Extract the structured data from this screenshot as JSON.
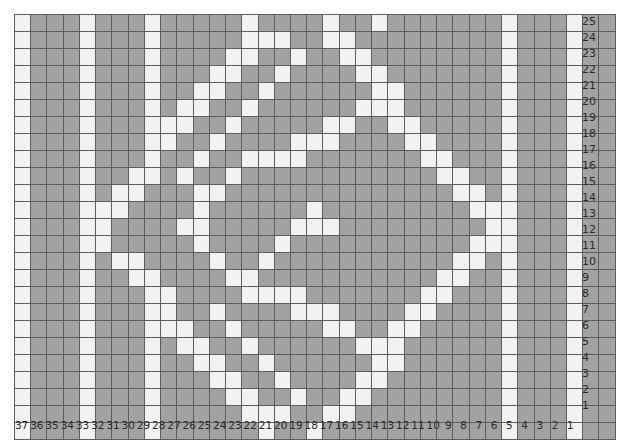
{
  "chart": {
    "title": "",
    "type": "grid-pattern-chart",
    "filled_color": "#a2a2a2",
    "empty_color": "#f2f2f2",
    "grid_line_color": "#5d5d5d",
    "columns": 37,
    "rows": 25,
    "column_order": "right-to-left",
    "row_order": "bottom-to-top",
    "column_labels": [
      37,
      36,
      35,
      34,
      33,
      32,
      31,
      30,
      29,
      28,
      27,
      26,
      25,
      24,
      23,
      22,
      21,
      20,
      19,
      18,
      17,
      16,
      15,
      14,
      13,
      12,
      11,
      10,
      9,
      8,
      7,
      6,
      5,
      4,
      3,
      2,
      1
    ],
    "row_labels": [
      25,
      24,
      23,
      22,
      21,
      20,
      19,
      18,
      17,
      16,
      15,
      14,
      13,
      12,
      11,
      10,
      9,
      8,
      7,
      6,
      5,
      4,
      3,
      2,
      1
    ]
  },
  "chart_data": {
    "type": "heatmap",
    "title": "",
    "xlabel": "",
    "ylabel": "",
    "legend": [
      {
        "key": "1",
        "label": "filled",
        "color": "#a2a2a2"
      },
      {
        "key": "0",
        "label": "empty",
        "color": "#f2f2f2"
      }
    ],
    "x": [
      37,
      36,
      35,
      34,
      33,
      32,
      31,
      30,
      29,
      28,
      27,
      26,
      25,
      24,
      23,
      22,
      21,
      20,
      19,
      18,
      17,
      16,
      15,
      14,
      13,
      12,
      11,
      10,
      9,
      8,
      7,
      6,
      5,
      4,
      3,
      2,
      1
    ],
    "y": [
      25,
      24,
      23,
      22,
      21,
      20,
      19,
      18,
      17,
      16,
      15,
      14,
      13,
      12,
      11,
      10,
      9,
      8,
      7,
      6,
      5,
      4,
      3,
      2,
      1
    ],
    "grid": [
      [
        0,
        1,
        1,
        1,
        0,
        1,
        1,
        1,
        0,
        1,
        1,
        1,
        1,
        1,
        0,
        1,
        1,
        1,
        1,
        0,
        1,
        1,
        0,
        1,
        1,
        1,
        1,
        1,
        1,
        1,
        0,
        1,
        1,
        1,
        0,
        1,
        1
      ],
      [
        0,
        1,
        1,
        1,
        0,
        1,
        1,
        1,
        0,
        1,
        1,
        1,
        1,
        1,
        0,
        0,
        0,
        1,
        1,
        0,
        0,
        1,
        1,
        1,
        1,
        1,
        1,
        1,
        1,
        1,
        0,
        1,
        1,
        1,
        0,
        1,
        1
      ],
      [
        0,
        1,
        1,
        1,
        0,
        1,
        1,
        1,
        0,
        1,
        1,
        1,
        1,
        0,
        0,
        1,
        1,
        0,
        1,
        1,
        0,
        0,
        1,
        1,
        1,
        1,
        1,
        1,
        1,
        1,
        0,
        1,
        1,
        1,
        0,
        1,
        1
      ],
      [
        0,
        1,
        1,
        1,
        0,
        1,
        1,
        1,
        0,
        1,
        1,
        1,
        0,
        0,
        1,
        1,
        0,
        1,
        1,
        1,
        1,
        0,
        0,
        1,
        1,
        1,
        1,
        1,
        1,
        1,
        0,
        1,
        1,
        1,
        0,
        1,
        1
      ],
      [
        0,
        1,
        1,
        1,
        0,
        1,
        1,
        1,
        0,
        1,
        1,
        0,
        0,
        1,
        1,
        0,
        1,
        1,
        1,
        1,
        1,
        1,
        0,
        0,
        1,
        1,
        1,
        1,
        1,
        1,
        0,
        1,
        1,
        1,
        0,
        1,
        1
      ],
      [
        0,
        1,
        1,
        1,
        0,
        1,
        1,
        1,
        0,
        1,
        0,
        0,
        1,
        1,
        0,
        1,
        1,
        1,
        1,
        1,
        1,
        0,
        0,
        0,
        1,
        1,
        1,
        1,
        1,
        1,
        0,
        1,
        1,
        1,
        0,
        1,
        1
      ],
      [
        0,
        1,
        1,
        1,
        0,
        1,
        1,
        1,
        0,
        0,
        0,
        1,
        1,
        0,
        1,
        1,
        1,
        1,
        1,
        0,
        0,
        1,
        1,
        0,
        0,
        1,
        1,
        1,
        1,
        1,
        0,
        1,
        1,
        1,
        0,
        1,
        1
      ],
      [
        0,
        1,
        1,
        1,
        0,
        1,
        1,
        1,
        0,
        0,
        1,
        1,
        0,
        1,
        1,
        1,
        1,
        0,
        0,
        0,
        1,
        1,
        1,
        1,
        0,
        0,
        1,
        1,
        1,
        1,
        0,
        1,
        1,
        1,
        0,
        1,
        1
      ],
      [
        0,
        1,
        1,
        1,
        0,
        1,
        1,
        1,
        0,
        1,
        1,
        0,
        1,
        1,
        0,
        0,
        0,
        0,
        1,
        1,
        1,
        1,
        1,
        1,
        1,
        0,
        0,
        1,
        1,
        1,
        0,
        1,
        1,
        1,
        0,
        1,
        1
      ],
      [
        0,
        1,
        1,
        1,
        0,
        1,
        1,
        0,
        0,
        1,
        0,
        1,
        1,
        0,
        1,
        1,
        1,
        1,
        1,
        1,
        1,
        1,
        1,
        1,
        1,
        1,
        0,
        0,
        1,
        1,
        0,
        1,
        1,
        1,
        0,
        1,
        1
      ],
      [
        0,
        1,
        1,
        1,
        0,
        1,
        0,
        0,
        1,
        1,
        1,
        0,
        0,
        1,
        1,
        1,
        1,
        1,
        1,
        1,
        1,
        1,
        1,
        1,
        1,
        1,
        1,
        0,
        0,
        1,
        0,
        1,
        1,
        1,
        0,
        1,
        1
      ],
      [
        0,
        1,
        1,
        1,
        0,
        0,
        0,
        1,
        1,
        1,
        1,
        0,
        1,
        1,
        1,
        1,
        1,
        1,
        0,
        1,
        1,
        1,
        1,
        1,
        1,
        1,
        1,
        1,
        0,
        0,
        0,
        1,
        1,
        1,
        0,
        1,
        1
      ],
      [
        0,
        1,
        1,
        1,
        0,
        0,
        1,
        1,
        1,
        1,
        0,
        0,
        1,
        1,
        1,
        1,
        1,
        0,
        0,
        0,
        1,
        1,
        1,
        1,
        1,
        1,
        1,
        1,
        1,
        0,
        0,
        1,
        1,
        1,
        0,
        1,
        1
      ],
      [
        0,
        1,
        1,
        1,
        0,
        0,
        1,
        1,
        1,
        1,
        1,
        0,
        1,
        1,
        1,
        1,
        0,
        1,
        1,
        1,
        1,
        1,
        1,
        1,
        1,
        1,
        1,
        1,
        0,
        0,
        0,
        1,
        1,
        1,
        0,
        1,
        1
      ],
      [
        0,
        1,
        1,
        1,
        0,
        1,
        0,
        0,
        1,
        1,
        1,
        1,
        0,
        1,
        1,
        0,
        1,
        1,
        1,
        1,
        1,
        1,
        1,
        1,
        1,
        1,
        1,
        0,
        0,
        1,
        0,
        1,
        1,
        1,
        0,
        1,
        1
      ],
      [
        0,
        1,
        1,
        1,
        0,
        1,
        1,
        0,
        0,
        1,
        1,
        1,
        1,
        0,
        0,
        1,
        1,
        1,
        1,
        1,
        1,
        1,
        1,
        1,
        1,
        1,
        0,
        0,
        1,
        1,
        0,
        1,
        1,
        1,
        0,
        1,
        1
      ],
      [
        0,
        1,
        1,
        1,
        0,
        1,
        1,
        1,
        0,
        0,
        1,
        1,
        1,
        1,
        0,
        0,
        0,
        0,
        1,
        1,
        1,
        1,
        1,
        1,
        1,
        0,
        0,
        1,
        1,
        1,
        0,
        1,
        1,
        1,
        0,
        1,
        1
      ],
      [
        0,
        1,
        1,
        1,
        0,
        1,
        1,
        1,
        0,
        0,
        1,
        1,
        0,
        1,
        1,
        1,
        1,
        0,
        0,
        0,
        1,
        1,
        1,
        1,
        0,
        0,
        1,
        1,
        1,
        1,
        0,
        1,
        1,
        1,
        0,
        1,
        1
      ],
      [
        0,
        1,
        1,
        1,
        0,
        1,
        1,
        1,
        0,
        0,
        0,
        1,
        1,
        0,
        1,
        1,
        1,
        1,
        1,
        0,
        0,
        1,
        1,
        0,
        0,
        1,
        1,
        1,
        1,
        1,
        0,
        1,
        1,
        1,
        0,
        1,
        1
      ],
      [
        0,
        1,
        1,
        1,
        0,
        1,
        1,
        1,
        0,
        1,
        0,
        0,
        1,
        1,
        0,
        1,
        1,
        1,
        1,
        1,
        1,
        0,
        0,
        0,
        1,
        1,
        1,
        1,
        1,
        1,
        0,
        1,
        1,
        1,
        0,
        1,
        1
      ],
      [
        0,
        1,
        1,
        1,
        0,
        1,
        1,
        1,
        0,
        1,
        1,
        0,
        0,
        1,
        1,
        0,
        1,
        1,
        1,
        1,
        1,
        1,
        0,
        0,
        1,
        1,
        1,
        1,
        1,
        1,
        0,
        1,
        1,
        1,
        0,
        1,
        1
      ],
      [
        0,
        1,
        1,
        1,
        0,
        1,
        1,
        1,
        0,
        1,
        1,
        1,
        0,
        0,
        1,
        1,
        0,
        1,
        1,
        1,
        1,
        0,
        0,
        1,
        1,
        1,
        1,
        1,
        1,
        1,
        0,
        1,
        1,
        1,
        0,
        1,
        1
      ],
      [
        0,
        1,
        1,
        1,
        0,
        1,
        1,
        1,
        0,
        1,
        1,
        1,
        1,
        0,
        0,
        1,
        1,
        0,
        1,
        1,
        0,
        0,
        1,
        1,
        1,
        1,
        1,
        1,
        1,
        1,
        0,
        1,
        1,
        1,
        0,
        1,
        1
      ],
      [
        0,
        1,
        1,
        1,
        0,
        1,
        1,
        1,
        0,
        1,
        1,
        1,
        1,
        1,
        0,
        0,
        0,
        1,
        1,
        0,
        0,
        1,
        1,
        1,
        1,
        1,
        1,
        1,
        1,
        1,
        0,
        1,
        1,
        1,
        0,
        1,
        1
      ],
      [
        0,
        1,
        1,
        1,
        0,
        1,
        1,
        1,
        0,
        1,
        1,
        1,
        1,
        1,
        1,
        0,
        1,
        1,
        0,
        1,
        1,
        1,
        1,
        1,
        1,
        1,
        1,
        1,
        1,
        1,
        0,
        1,
        1,
        1,
        0,
        1,
        1
      ]
    ]
  }
}
